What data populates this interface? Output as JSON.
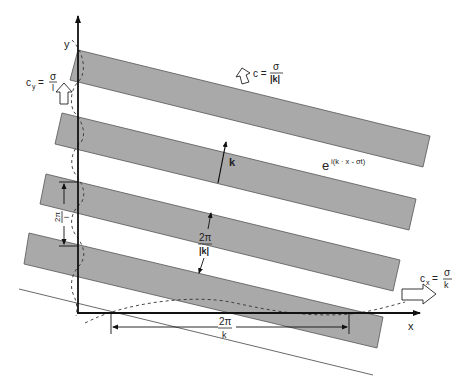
{
  "diagram": {
    "type": "plane-wave-phase-fronts",
    "colors": {
      "band_fill": "#a9a9a9",
      "band_edge": "#555555",
      "axis": "#111111",
      "background": "#ffffff"
    },
    "axes": {
      "x_label": "x",
      "y_label": "y"
    },
    "labels": {
      "phase_speed": {
        "lhs": "c =",
        "num": "σ",
        "den": "|k|"
      },
      "cy": {
        "lhs": "c",
        "sub": "y",
        "eq": "=",
        "num": "σ",
        "den": "l"
      },
      "cx": {
        "lhs": "c",
        "sub": "x",
        "eq": "=",
        "num": "σ",
        "den": "k"
      },
      "wave_expr": {
        "base": "e",
        "exponent": "i(k · x - σt)"
      },
      "wavenumber_vector": "k",
      "normal_wavelength": {
        "num": "2π",
        "den": "|k|"
      },
      "y_wavelength": {
        "num": "2π",
        "den": "l"
      },
      "x_wavelength": {
        "num": "2π",
        "den": "k"
      }
    },
    "bands_count": 4,
    "caption_fragment": ""
  }
}
